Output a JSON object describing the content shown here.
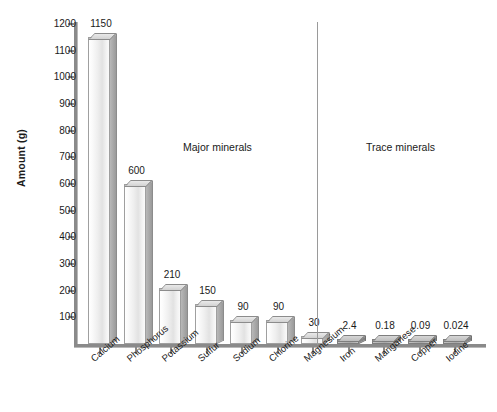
{
  "chart_data": {
    "type": "bar",
    "title": "",
    "xlabel": "",
    "ylabel": "Amount (g)",
    "ylim": [
      0,
      1200
    ],
    "grid": false,
    "legend": "none",
    "categories": [
      "Calcium",
      "Phosphorus",
      "Potassium",
      "Sulfur",
      "Sodium",
      "Chlorine",
      "Magnesium",
      "Iron",
      "Manganese",
      "Copper",
      "Iodine"
    ],
    "values": [
      1150,
      600,
      210,
      150,
      90,
      90,
      30,
      2.4,
      0.18,
      0.09,
      0.024
    ],
    "value_labels": [
      "1150",
      "600",
      "210",
      "150",
      "90",
      "90",
      "30",
      "2.4",
      "0.18",
      "0.09",
      "0.024"
    ],
    "y_ticks": [
      1200,
      1100,
      1000,
      900,
      800,
      700,
      600,
      500,
      400,
      300,
      200,
      100
    ],
    "y_tick_labels": [
      "1200",
      "1100",
      "1000",
      "900",
      "800",
      "700",
      "600",
      "500",
      "400",
      "300",
      "200",
      "100"
    ],
    "annotations": [
      {
        "text": "Major minerals",
        "group": "major"
      },
      {
        "text": "Trace minerals",
        "group": "trace"
      }
    ],
    "groups": [
      {
        "name": "Major minerals",
        "categories": [
          "Calcium",
          "Phosphorus",
          "Potassium",
          "Sulfur",
          "Sodium",
          "Chlorine",
          "Magnesium"
        ]
      },
      {
        "name": "Trace minerals",
        "categories": [
          "Iron",
          "Manganese",
          "Copper",
          "Iodine"
        ]
      }
    ],
    "colors": {
      "major_bar": "#e9e9e9",
      "trace_bar": "#aeaeae",
      "axis": "#8a8a8a",
      "text": "#1a1a1a",
      "divider": "#9a9a9a"
    }
  },
  "axis": {
    "y_title": "Amount (g)"
  },
  "captions": {
    "major": "Major minerals",
    "trace": "Trace minerals"
  }
}
